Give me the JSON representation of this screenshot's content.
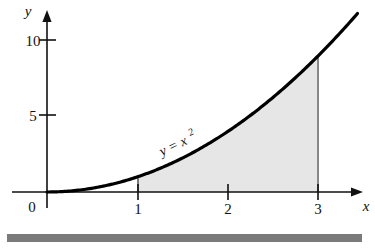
{
  "figure": {
    "kind": "math-graph",
    "axis_labels": {
      "x": "x",
      "y": "y"
    },
    "origin_label": "0",
    "curve_label_base": "y = x",
    "curve_label_exponent": "2",
    "x_tick_labels": [
      "1",
      "2",
      "3"
    ],
    "y_tick_labels": [
      "5",
      "10"
    ],
    "colors": {
      "axis": "#111111",
      "curve": "#000000",
      "shading": "#e6e6e6",
      "bottom_bar": "#7a7a7a",
      "background": "#ffffff"
    }
  },
  "chart_data": {
    "type": "line",
    "title": "",
    "xlabel": "x",
    "ylabel": "y",
    "function": "y = x^2",
    "series": [
      {
        "name": "y = x^2",
        "x": [
          0,
          0.25,
          0.5,
          0.75,
          1,
          1.25,
          1.5,
          1.75,
          2,
          2.25,
          2.5,
          2.75,
          3,
          3.25,
          3.45
        ],
        "values": [
          0,
          0.0625,
          0.25,
          0.5625,
          1,
          1.5625,
          2.25,
          3.0625,
          4,
          5.0625,
          6.25,
          7.5625,
          9,
          10.5625,
          11.9
        ]
      }
    ],
    "xlim": [
      0,
      3.45
    ],
    "ylim": [
      0,
      12.2
    ],
    "xticks": [
      1,
      2,
      3
    ],
    "xticklabels": [
      "1",
      "2",
      "3"
    ],
    "yticks": [
      5,
      10
    ],
    "yticklabels": [
      "5",
      "10"
    ],
    "grid": false,
    "legend": false,
    "annotations": [
      {
        "text": "y = x²",
        "x": 1.42,
        "y": 3.1,
        "rotation": -25
      },
      {
        "text": "0",
        "x": 0,
        "y": 0
      }
    ],
    "shaded_region": {
      "label": "area under curve",
      "x_from": 1,
      "x_to": 3,
      "y_from": 0,
      "y_to_curve": "y = x^2",
      "fill": "#e6e6e6",
      "area_value": 8.6667
    }
  }
}
